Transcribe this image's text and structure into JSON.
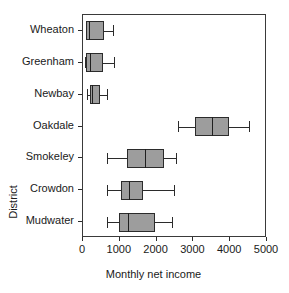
{
  "chart_data": {
    "type": "box",
    "title": "",
    "xlabel": "Monthly net income",
    "ylabel": "District",
    "xlim": [
      0,
      5000
    ],
    "xticks": [
      0,
      1000,
      2000,
      3000,
      4000,
      5000
    ],
    "xtick_labels": [
      "0",
      "1000",
      "2000",
      "3000",
      "4000",
      "5000"
    ],
    "grid": false,
    "legend": "none",
    "orientation": "horizontal",
    "categories": [
      "Wheaton",
      "Greenham",
      "Newbay",
      "Oakdale",
      "Smokeley",
      "Crowdon",
      "Mudwater"
    ],
    "boxes": [
      {
        "category": "Wheaton",
        "whisker_low": 80,
        "q1": 90,
        "median": 170,
        "q3": 570,
        "whisker_high": 810
      },
      {
        "category": "Greenham",
        "whisker_low": 60,
        "q1": 80,
        "median": 180,
        "q3": 540,
        "whisker_high": 840
      },
      {
        "category": "Newbay",
        "whisker_low": 110,
        "q1": 200,
        "median": 240,
        "q3": 450,
        "whisker_high": 650
      },
      {
        "category": "Oakdale",
        "whisker_low": 2570,
        "q1": 3050,
        "median": 3510,
        "q3": 3970,
        "whisker_high": 4510
      },
      {
        "category": "Smokeley",
        "whisker_low": 650,
        "q1": 1190,
        "median": 1680,
        "q3": 2190,
        "whisker_high": 2540
      },
      {
        "category": "Crowdon",
        "whisker_low": 650,
        "q1": 1030,
        "median": 1240,
        "q3": 1620,
        "whisker_high": 2460
      },
      {
        "category": "Mudwater",
        "whisker_low": 650,
        "q1": 970,
        "median": 1220,
        "q3": 1970,
        "whisker_high": 2430
      }
    ],
    "colors": {
      "box_fill": "#9d9d9d",
      "box_stroke": "#2b2b2b",
      "axis": "#3a3a3a",
      "text": "#1a1a1a",
      "background": "#ffffff"
    }
  }
}
